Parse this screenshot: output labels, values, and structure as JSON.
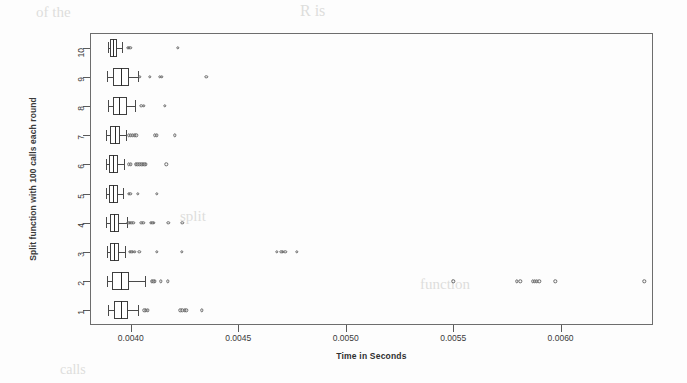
{
  "figure": {
    "kind": "boxplot-figure",
    "background": "#fdfdfd",
    "line_color": "#4a4a4a",
    "frame_color": "#6d6d6d"
  },
  "axis": {
    "x_label": "Time in Seconds",
    "y_label": "Split function with 100 calls each round",
    "x_ticks": [
      "0.0040",
      "0.0045",
      "0.0050",
      "0.0055",
      "0.0060"
    ],
    "y_ticks": [
      "1",
      "2",
      "3",
      "4",
      "5",
      "6",
      "7",
      "8",
      "9",
      "10"
    ]
  },
  "ghost_text": {
    "t1": "of the",
    "t2": "R is",
    "t3": "split",
    "t4": "function",
    "t5": "calls"
  },
  "chart_data": {
    "type": "box",
    "orientation": "horizontal",
    "title": "",
    "xlabel": "Time in Seconds",
    "ylabel": "Split function with 100 calls each round",
    "xlim": [
      0.00381,
      0.00643
    ],
    "x_ticks": [
      0.004,
      0.0045,
      0.005,
      0.0055,
      0.006
    ],
    "categories": [
      "1",
      "2",
      "3",
      "4",
      "5",
      "6",
      "7",
      "8",
      "9",
      "10"
    ],
    "grid": false,
    "legend": "none",
    "boxes": [
      {
        "category": "1",
        "whisker_low": 0.003892,
        "q1": 0.00392,
        "median": 0.003955,
        "q3": 0.003985,
        "whisker_high": 0.004035,
        "outliers": [
          0.004062,
          0.00407,
          0.004078,
          0.00423,
          0.00424,
          0.00425,
          0.004258,
          0.00433
        ]
      },
      {
        "category": "2",
        "whisker_low": 0.00389,
        "q1": 0.003912,
        "median": 0.003955,
        "q3": 0.003993,
        "whisker_high": 0.004068,
        "outliers": [
          0.004098,
          0.004105,
          0.004112,
          0.00414,
          0.004172,
          0.0055,
          0.005795,
          0.005812,
          0.00587,
          0.00588,
          0.00589,
          0.0059,
          0.005975,
          0.00639
        ]
      },
      {
        "category": "3",
        "whisker_low": 0.003888,
        "q1": 0.003905,
        "median": 0.003922,
        "q3": 0.003945,
        "whisker_high": 0.003975,
        "outliers": [
          0.003995,
          0.004002,
          0.004008,
          0.004018,
          0.00404,
          0.004122,
          0.004238,
          0.00468,
          0.0047,
          0.004708,
          0.004718,
          0.004772
        ]
      },
      {
        "category": "4",
        "whisker_low": 0.003885,
        "q1": 0.003902,
        "median": 0.00392,
        "q3": 0.003945,
        "whisker_high": 0.003982,
        "outliers": [
          0.003988,
          0.003995,
          0.004002,
          0.004012,
          0.004048,
          0.004058,
          0.004092,
          0.0041,
          0.004108,
          0.004175,
          0.00424
        ]
      },
      {
        "category": "5",
        "whisker_low": 0.003886,
        "q1": 0.0039,
        "median": 0.003918,
        "q3": 0.00394,
        "whisker_high": 0.003962,
        "outliers": [
          0.00399,
          0.003998,
          0.004032,
          0.004122
        ]
      },
      {
        "category": "6",
        "whisker_low": 0.003884,
        "q1": 0.0039,
        "median": 0.003918,
        "q3": 0.003942,
        "whisker_high": 0.00397,
        "outliers": [
          0.003992,
          0.004,
          0.004022,
          0.00403,
          0.00404,
          0.004048,
          0.004056,
          0.004062,
          0.00407,
          0.004165
        ]
      },
      {
        "category": "7",
        "whisker_low": 0.003886,
        "q1": 0.003902,
        "median": 0.003925,
        "q3": 0.00395,
        "whisker_high": 0.003978,
        "outliers": [
          0.003992,
          0.004,
          0.004008,
          0.004018,
          0.004026,
          0.004112,
          0.00412,
          0.004205
        ]
      },
      {
        "category": "8",
        "whisker_low": 0.003892,
        "q1": 0.003918,
        "median": 0.003945,
        "q3": 0.003982,
        "whisker_high": 0.00402,
        "outliers": [
          0.004048,
          0.00406,
          0.004158
        ]
      },
      {
        "category": "9",
        "whisker_low": 0.00389,
        "q1": 0.003918,
        "median": 0.003952,
        "q3": 0.003992,
        "whisker_high": 0.004032,
        "outliers": [
          0.004042,
          0.004088,
          0.004135,
          0.004145,
          0.004352
        ]
      },
      {
        "category": "10",
        "whisker_low": 0.003895,
        "q1": 0.003905,
        "median": 0.003918,
        "q3": 0.003935,
        "whisker_high": 0.00396,
        "outliers": [
          0.003985,
          0.003992,
          0.003998,
          0.004218
        ]
      }
    ]
  }
}
